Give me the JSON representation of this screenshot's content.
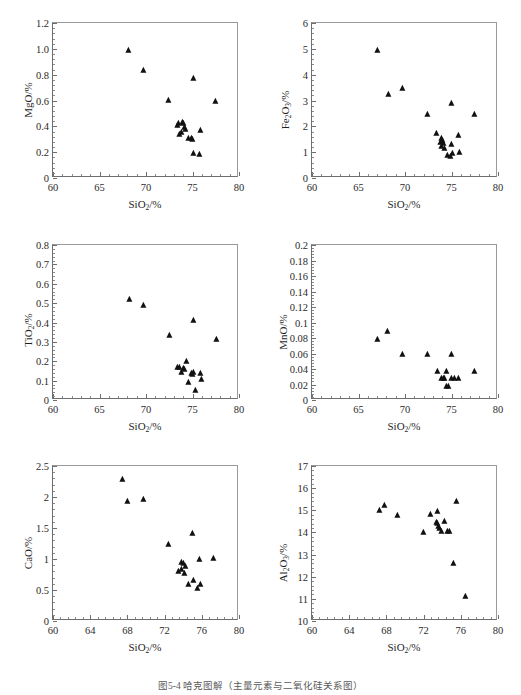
{
  "figure": {
    "caption": "图5-4  哈克图解（主量元素与二氧化硅关系图）",
    "marker": "filled-triangle",
    "marker_color": "#111111",
    "axis_color": "#6e6e6e",
    "background": "#ffffff"
  },
  "chart_data": [
    {
      "id": "mgo",
      "type": "scatter",
      "title": "",
      "xlabel": "SiO2/%",
      "ylabel": "MgO/%",
      "xlabel_html": "SiO<sub>2</sub>/%",
      "ylabel_html": "MgO/%",
      "xlim": [
        60,
        80
      ],
      "ylim": [
        0,
        1.2
      ],
      "xticks": [
        60,
        65,
        70,
        75,
        80
      ],
      "yticks": [
        0,
        0.2,
        0.4,
        0.6,
        0.8,
        1.0,
        1.2
      ],
      "ytick_labels": [
        "0",
        "0.2",
        "0.4",
        "0.6",
        "0.8",
        "1.0",
        "1.2"
      ],
      "xtick_labels": [
        "60",
        "65",
        "70",
        "75",
        "80"
      ],
      "grid": false,
      "legend": null,
      "x": [
        68.2,
        69.8,
        72.5,
        75.2,
        77.5,
        73.4,
        73.6,
        74.0,
        74.1,
        74.2,
        73.9,
        74.3,
        73.7,
        74.6,
        75.0,
        74.9,
        75.9,
        75.2,
        75.8
      ],
      "y": [
        0.97,
        0.81,
        0.58,
        0.75,
        0.57,
        0.39,
        0.4,
        0.41,
        0.4,
        0.37,
        0.33,
        0.36,
        0.32,
        0.29,
        0.28,
        0.29,
        0.35,
        0.17,
        0.16
      ]
    },
    {
      "id": "fe2o3",
      "type": "scatter",
      "title": "",
      "xlabel": "SiO2/%",
      "ylabel": "Fe2O3/%",
      "xlabel_html": "SiO<sub>2</sub>/%",
      "ylabel_html": "Fe<sub>2</sub>O<sub>3</sub>/%",
      "xlim": [
        60,
        80
      ],
      "ylim": [
        0,
        6
      ],
      "xticks": [
        60,
        65,
        70,
        75,
        80
      ],
      "yticks": [
        0,
        1,
        2,
        3,
        4,
        5,
        6
      ],
      "ytick_labels": [
        "0",
        "1",
        "2",
        "3",
        "4",
        "5",
        "6"
      ],
      "xtick_labels": [
        "60",
        "65",
        "70",
        "75",
        "80"
      ],
      "grid": false,
      "legend": null,
      "x": [
        67.1,
        68.3,
        69.8,
        72.5,
        75.0,
        77.5,
        73.4,
        74.0,
        74.1,
        73.9,
        74.2,
        74.0,
        74.3,
        75.1,
        75.8,
        74.6,
        75.2,
        75.9,
        74.9
      ],
      "y": [
        4.85,
        3.12,
        3.38,
        2.36,
        2.8,
        2.37,
        1.64,
        1.42,
        1.36,
        1.29,
        1.22,
        1.12,
        1.05,
        1.2,
        1.53,
        0.77,
        0.86,
        0.88,
        0.72
      ]
    },
    {
      "id": "tio2",
      "type": "scatter",
      "title": "",
      "xlabel": "SiO2/%",
      "ylabel": "TiO2/%",
      "xlabel_html": "SiO<sub>2</sub>/%",
      "ylabel_html": "TiO<sub>2</sub>/%",
      "xlim": [
        60,
        80
      ],
      "ylim": [
        0,
        0.8
      ],
      "xticks": [
        60,
        65,
        70,
        75,
        80
      ],
      "yticks": [
        0,
        0.1,
        0.2,
        0.3,
        0.4,
        0.5,
        0.6,
        0.7,
        0.8
      ],
      "ytick_labels": [
        "0",
        "0.1",
        "0.2",
        "0.3",
        "0.4",
        "0.5",
        "0.6",
        "0.7",
        "0.8"
      ],
      "xtick_labels": [
        "60",
        "65",
        "70",
        "75",
        "80"
      ],
      "grid": false,
      "legend": null,
      "x": [
        68.3,
        69.8,
        72.6,
        75.2,
        77.6,
        74.4,
        73.4,
        73.7,
        74.1,
        74.2,
        73.9,
        74.9,
        75.1,
        75.2,
        75.9,
        74.6,
        76.0,
        75.4
      ],
      "y": [
        0.505,
        0.473,
        0.318,
        0.398,
        0.297,
        0.188,
        0.155,
        0.157,
        0.152,
        0.147,
        0.13,
        0.125,
        0.12,
        0.127,
        0.126,
        0.079,
        0.092,
        0.035
      ]
    },
    {
      "id": "mno",
      "type": "scatter",
      "title": "",
      "xlabel": "SiO2/%",
      "ylabel": "MnO/%",
      "xlabel_html": "SiO<sub>2</sub>/%",
      "ylabel_html": "MnO/%",
      "xlim": [
        60,
        80
      ],
      "ylim": [
        0,
        0.2
      ],
      "xticks": [
        60,
        65,
        70,
        75,
        80
      ],
      "yticks": [
        0,
        0.02,
        0.04,
        0.06,
        0.08,
        0.1,
        0.12,
        0.14,
        0.16,
        0.18,
        0.2
      ],
      "ytick_labels": [
        "0",
        "0.02",
        "0.04",
        "0.06",
        "0.08",
        "0.1",
        "0.12",
        "0.14",
        "0.16",
        "0.18",
        "0.2"
      ],
      "xtick_labels": [
        "60",
        "65",
        "70",
        "75",
        "80"
      ],
      "grid": false,
      "legend": null,
      "x": [
        67.1,
        68.2,
        69.8,
        72.5,
        75.0,
        73.6,
        74.5,
        77.5,
        74.0,
        74.2,
        74.3,
        75.1,
        75.4,
        75.8,
        74.5,
        74.7
      ],
      "y": [
        0.075,
        0.085,
        0.055,
        0.055,
        0.055,
        0.034,
        0.034,
        0.034,
        0.024,
        0.024,
        0.024,
        0.024,
        0.024,
        0.024,
        0.014,
        0.014
      ]
    },
    {
      "id": "cao",
      "type": "scatter",
      "title": "",
      "xlabel": "SiO2/%",
      "ylabel": "CaO/%",
      "xlabel_html": "SiO<sub>2</sub>/%",
      "ylabel_html": "CaO/%",
      "xlim": [
        60,
        80
      ],
      "ylim": [
        0,
        2.5
      ],
      "xticks": [
        60,
        64,
        68,
        72,
        76,
        80
      ],
      "yticks": [
        0,
        0.5,
        1,
        1.5,
        2,
        2.5
      ],
      "ytick_labels": [
        "0",
        "0.5",
        "1",
        "1.5",
        "2",
        "2.5"
      ],
      "xtick_labels": [
        "60",
        "64",
        "68",
        "72",
        "76",
        "80"
      ],
      "grid": false,
      "legend": null,
      "x": [
        67.5,
        68.1,
        69.8,
        72.5,
        75.0,
        75.8,
        77.3,
        73.9,
        74.1,
        74.3,
        73.6,
        73.9,
        74.2,
        74.6,
        75.2,
        75.6,
        75.9
      ],
      "y": [
        2.24,
        1.88,
        1.92,
        1.19,
        1.37,
        0.95,
        0.97,
        0.91,
        0.88,
        0.84,
        0.76,
        0.79,
        0.73,
        0.55,
        0.62,
        0.48,
        0.55
      ]
    },
    {
      "id": "al2o3",
      "type": "scatter",
      "title": "",
      "xlabel": "SiO2/%",
      "ylabel": "Al2O3/%",
      "xlabel_html": "SiO<sub>2</sub>/%",
      "ylabel_html": "Al<sub>2</sub>O<sub>3</sub>/%",
      "xlim": [
        60,
        80
      ],
      "ylim": [
        10,
        17
      ],
      "xticks": [
        60,
        64,
        68,
        72,
        76,
        80
      ],
      "yticks": [
        10,
        11,
        12,
        13,
        14,
        15,
        16,
        17
      ],
      "ytick_labels": [
        "10",
        "11",
        "12",
        "13",
        "14",
        "15",
        "16",
        "17"
      ],
      "xtick_labels": [
        "60",
        "64",
        "68",
        "72",
        "76",
        "80"
      ],
      "grid": false,
      "legend": null,
      "x": [
        67.3,
        67.9,
        69.2,
        72.0,
        72.8,
        73.6,
        75.6,
        73.4,
        73.5,
        74.3,
        73.7,
        73.8,
        74.0,
        74.6,
        74.8,
        75.3,
        76.6
      ],
      "y": [
        14.9,
        15.1,
        14.65,
        13.88,
        14.68,
        14.85,
        15.3,
        14.32,
        14.28,
        14.4,
        14.15,
        14.05,
        13.95,
        13.92,
        13.92,
        12.5,
        10.98,
        11.95
      ]
    }
  ]
}
